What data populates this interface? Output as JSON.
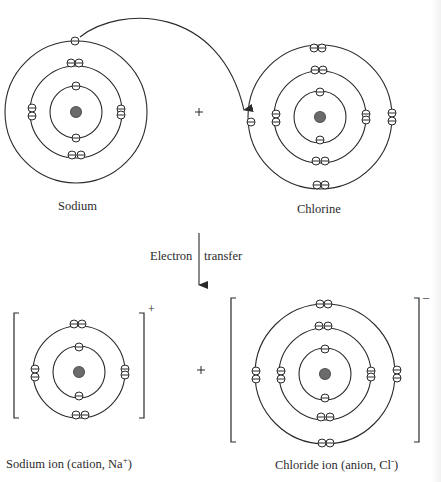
{
  "diagram": {
    "colors": {
      "line": "#2a2a2a",
      "nucleus": "#6b6b6b",
      "background": "#ffffff"
    },
    "reactants": {
      "sodium": {
        "label": "Sodium",
        "shells": [
          2,
          8,
          1
        ]
      },
      "plus": "+",
      "chlorine": {
        "label": "Chlorine",
        "shells": [
          2,
          8,
          7
        ]
      }
    },
    "transition": {
      "left_label": "Electron",
      "right_label": "transfer"
    },
    "products": {
      "sodium_ion": {
        "label_main": "Sodium ion  (cation, Na",
        "label_sup": "+",
        "label_end": ")",
        "charge": "+",
        "shells": [
          2,
          8
        ]
      },
      "plus": "+",
      "chloride_ion": {
        "label_main": "Chloride ion  (anion, Cl",
        "label_sup": "-",
        "label_end": ")",
        "charge": "–",
        "shells": [
          2,
          8,
          8
        ]
      }
    }
  }
}
